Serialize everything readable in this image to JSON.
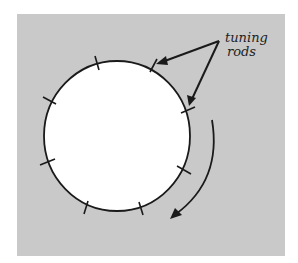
{
  "figure": {
    "background_color": "#c9c9c9",
    "circle_fill": "#ffffff",
    "stroke_color": "#1a1a1a",
    "label_line1": "tuning",
    "label_line2": "rods",
    "tick_count": 8,
    "rotation_direction": "clockwise"
  }
}
